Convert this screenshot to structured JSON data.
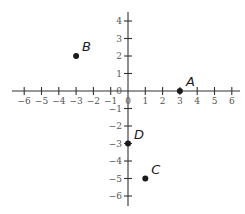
{
  "chart_data": {
    "type": "scatter",
    "title": "",
    "xlabel": "",
    "ylabel": "",
    "xlim": [
      -6.5,
      6.5
    ],
    "ylim": [
      -6.5,
      4.5
    ],
    "grid": false,
    "x_ticks": [
      -6,
      -5,
      -4,
      -3,
      -2,
      -1,
      0,
      1,
      2,
      3,
      4,
      5,
      6
    ],
    "x_tick_labels": [
      "−6",
      "−5",
      "−4",
      "−3",
      "−2",
      "−1",
      "0",
      "1",
      "2",
      "3",
      "4",
      "5",
      "6"
    ],
    "y_ticks": [
      4,
      3,
      2,
      1,
      0,
      -1,
      -2,
      -3,
      -4,
      -5,
      -6
    ],
    "y_tick_labels": [
      "4",
      "3",
      "2",
      "1",
      "0",
      "−1",
      "−2",
      "−3",
      "−4",
      "−5",
      "−6"
    ],
    "points": [
      {
        "label": "A",
        "x": 3,
        "y": 0
      },
      {
        "label": "B",
        "x": -3,
        "y": 2
      },
      {
        "label": "C",
        "x": 1,
        "y": -5
      },
      {
        "label": "D",
        "x": 0,
        "y": -3
      }
    ],
    "colors": {
      "axis": "#333333",
      "point": "#1a1a1a",
      "tick_label": "#555555"
    }
  }
}
